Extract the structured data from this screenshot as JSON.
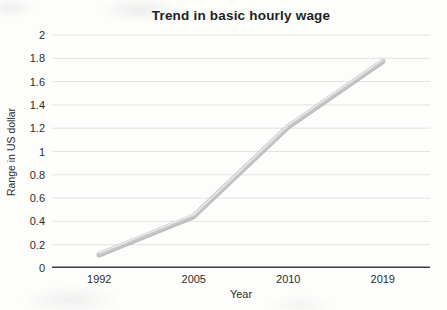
{
  "page": {
    "background_color": "#fdfdfc"
  },
  "chart_data": {
    "type": "line",
    "title": "Trend in basic hourly wage",
    "xlabel": "Year",
    "ylabel": "Range in US dollar",
    "categories": [
      "1992",
      "2005",
      "2010",
      "2019"
    ],
    "series": [
      {
        "name": "Basic hourly wage",
        "values": [
          0.12,
          0.45,
          1.22,
          1.78
        ]
      }
    ],
    "ylim": [
      0,
      2
    ],
    "ytick_step": 0.2,
    "ytick_labels": [
      "0",
      "0.2",
      "0.4",
      "0.6",
      "0.8",
      "1",
      "1.2",
      "1.4",
      "1.6",
      "1.8",
      "2"
    ],
    "grid": "horizontal",
    "legend": "none",
    "colors": {
      "line": "#c6c6c6",
      "line_shadow": "#9d9a97",
      "line_highlight": "#e9e9e9",
      "grid": "#e3e3e2",
      "axis": "#3f3f3f",
      "text": "#2d2d2d",
      "title": "#1f1f1f"
    }
  }
}
